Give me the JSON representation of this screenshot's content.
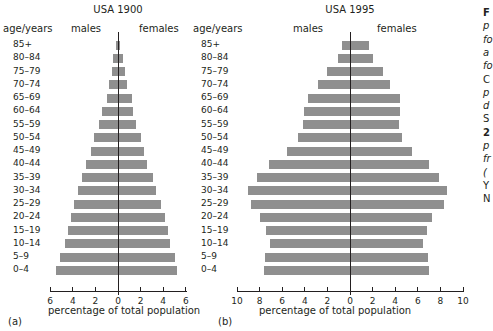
{
  "chart_data": [
    {
      "type": "bar",
      "orientation": "horizontal",
      "subtype": "population-pyramid",
      "title": "USA 1900",
      "panel_label": "(a)",
      "ylabel": "age/years",
      "xlabel": "percentage of total population",
      "xlim": [
        -6,
        6
      ],
      "xticks": [
        6,
        4,
        2,
        0,
        2,
        4,
        6
      ],
      "categories": [
        "85+",
        "80–84",
        "75–79",
        "70–74",
        "65–69",
        "60–64",
        "55–59",
        "50–54",
        "45–49",
        "40–44",
        "35–39",
        "30–34",
        "25–29",
        "20–24",
        "15–19",
        "10–14",
        "5–9",
        "0–4"
      ],
      "series": [
        {
          "name": "males",
          "values": [
            0.2,
            0.4,
            0.5,
            0.8,
            1.0,
            1.4,
            1.7,
            2.1,
            2.4,
            2.8,
            3.2,
            3.5,
            3.9,
            4.2,
            4.4,
            4.7,
            5.1,
            5.5
          ]
        },
        {
          "name": "females",
          "values": [
            0.2,
            0.4,
            0.6,
            0.8,
            1.2,
            1.3,
            1.6,
            2.0,
            2.3,
            2.6,
            3.1,
            3.4,
            3.8,
            4.2,
            4.4,
            4.6,
            5.0,
            5.2
          ]
        }
      ],
      "grid": false
    },
    {
      "type": "bar",
      "orientation": "horizontal",
      "subtype": "population-pyramid",
      "title": "USA 1995",
      "panel_label": "(b)",
      "ylabel": "age/years",
      "xlabel": "percentage of total population",
      "xlim": [
        -10,
        10
      ],
      "xticks": [
        10,
        8,
        6,
        4,
        2,
        0,
        2,
        4,
        6,
        8,
        10
      ],
      "categories": [
        "85+",
        "80–84",
        "75–79",
        "70–74",
        "65–69",
        "60–64",
        "55–59",
        "50–54",
        "45–49",
        "40–44",
        "35–39",
        "30–34",
        "25–29",
        "20–24",
        "15–19",
        "10–14",
        "5–9",
        "0–4"
      ],
      "series": [
        {
          "name": "males",
          "values": [
            0.7,
            1.1,
            2.0,
            2.8,
            3.7,
            4.1,
            4.2,
            4.6,
            5.6,
            7.2,
            8.2,
            9.0,
            8.8,
            8.0,
            7.4,
            7.1,
            7.5,
            7.6
          ]
        },
        {
          "name": "females",
          "values": [
            1.7,
            2.0,
            2.9,
            3.5,
            4.4,
            4.4,
            4.3,
            4.6,
            5.5,
            7.0,
            7.9,
            8.6,
            8.3,
            7.3,
            6.8,
            6.5,
            6.9,
            7.0
          ]
        }
      ],
      "grid": false
    }
  ],
  "colors": {
    "bar": "#8f8f8f",
    "axis": "#231f20",
    "text": "#231f20"
  },
  "labels": {
    "a": {
      "title": "USA 1900",
      "age_header": "age/years",
      "males": "males",
      "females": "females",
      "xlabel": "percentage of total population",
      "panel": "(a)"
    },
    "b": {
      "title": "USA 1995",
      "age_header": "age/years",
      "males": "males",
      "females": "females",
      "xlabel": "percentage of total population",
      "panel": "(b)"
    }
  },
  "caption_fragment": [
    {
      "text": "F",
      "style": "b"
    },
    {
      "text": "p",
      "style": "i"
    },
    {
      "text": "fo",
      "style": "i"
    },
    {
      "text": "a",
      "style": "i"
    },
    {
      "text": "fo",
      "style": "i"
    },
    {
      "text": "C",
      "style": ""
    },
    {
      "text": "p",
      "style": "i"
    },
    {
      "text": "d",
      "style": "i"
    },
    {
      "text": "S",
      "style": ""
    },
    {
      "text": "2",
      "style": "b"
    },
    {
      "text": "p",
      "style": "i"
    },
    {
      "text": "fr",
      "style": "i"
    },
    {
      "text": "(",
      "style": "i"
    },
    {
      "text": "Y",
      "style": ""
    },
    {
      "text": "N",
      "style": ""
    }
  ]
}
